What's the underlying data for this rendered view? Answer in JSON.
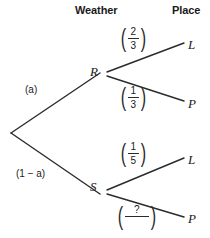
{
  "figure": {
    "type": "probability-tree-diagram",
    "line_color": "#2b2b2b",
    "text_color": "#1a1a1a",
    "background": "#ffffff"
  },
  "headers": {
    "weather": "Weather",
    "place": "Place"
  },
  "root": {
    "branches": [
      {
        "label": "(a)",
        "node": "R"
      },
      {
        "label": "(1 − a)",
        "node": "S"
      }
    ]
  },
  "nodes": {
    "r": "R",
    "s": "S"
  },
  "leaves": {
    "r_l": "L",
    "r_p": "P",
    "s_l": "L",
    "s_p": "P"
  },
  "fractions": {
    "r_l": {
      "open": "(",
      "num": "2",
      "den": "3",
      "close": ")"
    },
    "r_p": {
      "open": "(",
      "num": "1",
      "den": "3",
      "close": ")"
    },
    "s_l": {
      "open": "(",
      "num": "1",
      "den": "5",
      "close": ")"
    },
    "s_p": {
      "open": "(",
      "num": "?",
      "den": "",
      "close": ")"
    }
  }
}
